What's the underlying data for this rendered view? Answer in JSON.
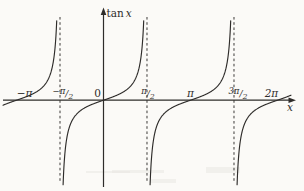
{
  "figure": {
    "background": "#fbfaf7",
    "ink_color": "#2e2c2a",
    "dash_color": "#3c3a38",
    "smudge_color": "#e9e8e3"
  },
  "chart_data": {
    "type": "line",
    "title": "",
    "function": "y = tan(x)",
    "ylabel": "tan x",
    "xlabel": "x",
    "x_range_rad": [
      -3.63,
      6.77
    ],
    "grid": false,
    "legend": "none",
    "branch_centers_rad": [
      -3.14159265,
      0,
      3.14159265,
      6.28318531
    ],
    "zero_crossings_rad": [
      -3.14159265,
      0,
      3.14159265,
      6.28318531
    ],
    "asymptotes_rad": [
      -1.57079633,
      1.57079633,
      4.71238898
    ],
    "asymptote_style": "dashed",
    "y_clip_units": 8.7,
    "x_ticks": [
      {
        "style": "plain",
        "text": "−π",
        "rad": -3.14159265,
        "dx": 8,
        "italic": true
      },
      {
        "style": "frac",
        "prefix": "−",
        "num": "π",
        "den": "2",
        "rad": -1.57079633,
        "dx": 3,
        "italic": true
      },
      {
        "style": "plain",
        "text": "0",
        "rad": 0,
        "dx": -6,
        "italic": false
      },
      {
        "style": "frac",
        "prefix": "",
        "num": "π",
        "den": "2",
        "rad": 1.57079633,
        "dx": 1,
        "italic": true
      },
      {
        "style": "plain",
        "text": "π",
        "rad": 3.14159265,
        "dx": 0,
        "italic": true
      },
      {
        "style": "frac",
        "prefix": "3",
        "num": "π",
        "den": "2",
        "rad": 4.71238898,
        "dx": 4,
        "italic": true
      },
      {
        "style": "plain",
        "text": "2π",
        "rad": 6.28318531,
        "dx": -6,
        "italic": true
      }
    ]
  }
}
